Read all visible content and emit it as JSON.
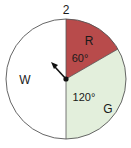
{
  "spinner": {
    "number": "2",
    "sectors": [
      {
        "label": "R",
        "angle": "60°",
        "color": "#b84b4b",
        "start_deg": 0,
        "end_deg": 60
      },
      {
        "label": "G",
        "angle": "120°",
        "color": "#e3efdc",
        "start_deg": 60,
        "end_deg": 180
      },
      {
        "label": "W",
        "color": "#ffffff",
        "start_deg": 180,
        "end_deg": 360
      }
    ],
    "arrow": {
      "direction": "upper-left"
    },
    "outline_color": "#555555"
  }
}
